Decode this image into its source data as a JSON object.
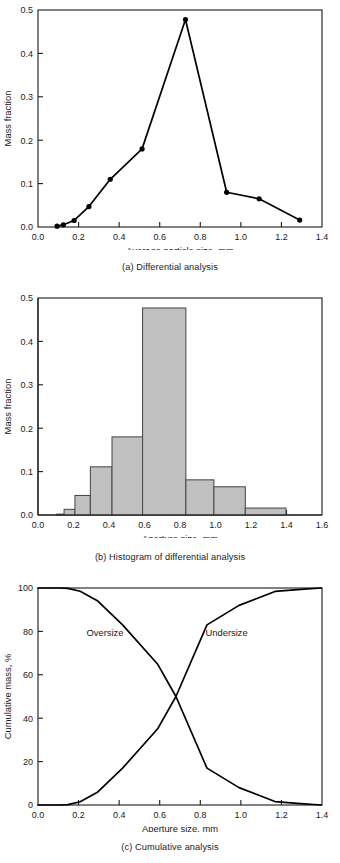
{
  "figure": {
    "panels": [
      {
        "id": "a",
        "caption": "(a) Differential analysis",
        "xlabel": "Average particle size, mm",
        "ylabel": "Mass fraction"
      },
      {
        "id": "b",
        "caption": "(b) Histogram of differential analysis",
        "xlabel": "Aperture size, mm",
        "ylabel": "Mass fraction"
      },
      {
        "id": "c",
        "caption": "(c) Cumulative analysis",
        "xlabel": "Aperture size, mm",
        "ylabel": "Cumulative mass, %"
      }
    ]
  },
  "chart_data": [
    {
      "type": "line",
      "title": "(a) Differential analysis",
      "xlabel": "Average particle size, mm",
      "ylabel": "Mass fraction",
      "xlim": [
        0.0,
        1.4
      ],
      "ylim": [
        0.0,
        0.5
      ],
      "xticks": [
        "0.0",
        "0.2",
        "0.4",
        "0.6",
        "0.8",
        "1.0",
        "1.2",
        "1.4"
      ],
      "xtick_values": [
        0.0,
        0.2,
        0.4,
        0.6,
        0.8,
        1.0,
        1.2,
        1.4
      ],
      "yticks": [
        "0.0",
        "0.1",
        "0.2",
        "0.3",
        "0.4",
        "0.5"
      ],
      "ytick_values": [
        0.0,
        0.1,
        0.2,
        0.3,
        0.4,
        0.5
      ],
      "grid": false,
      "legend": "none",
      "marker": "filled-circle",
      "x": [
        0.094,
        0.125,
        0.178,
        0.251,
        0.356,
        0.513,
        0.727,
        0.93,
        1.09,
        1.29
      ],
      "y": [
        0.002,
        0.005,
        0.015,
        0.047,
        0.11,
        0.18,
        0.478,
        0.08,
        0.065,
        0.016
      ],
      "series": [
        {
          "name": "Mass fraction",
          "values": [
            0.002,
            0.005,
            0.015,
            0.047,
            0.11,
            0.18,
            0.478,
            0.08,
            0.065,
            0.016
          ]
        }
      ]
    },
    {
      "type": "bar",
      "title": "(b) Histogram of differential analysis",
      "xlabel": "Aperture size, mm",
      "ylabel": "Mass fraction",
      "xlim": [
        0.0,
        1.6
      ],
      "ylim": [
        0.0,
        0.5
      ],
      "xticks": [
        "0.0",
        "0.2",
        "0.4",
        "0.6",
        "0.8",
        "1.0",
        "1.2",
        "1.4",
        "1.6"
      ],
      "xtick_values": [
        0.0,
        0.2,
        0.4,
        0.6,
        0.8,
        1.0,
        1.2,
        1.4,
        1.6
      ],
      "yticks": [
        "0.0",
        "0.1",
        "0.2",
        "0.3",
        "0.4",
        "0.5"
      ],
      "ytick_values": [
        0.0,
        0.1,
        0.2,
        0.3,
        0.4,
        0.5
      ],
      "grid": false,
      "legend": "none",
      "bin_edges": [
        0.105,
        0.147,
        0.208,
        0.295,
        0.417,
        0.589,
        0.833,
        0.991,
        1.168,
        1.397
      ],
      "bin_labels": [
        "0.105-0.147",
        "0.147-0.208",
        "0.208-0.295",
        "0.295-0.417",
        "0.417-0.589",
        "0.589-0.833",
        "0.833-0.991",
        "0.991-1.168",
        "1.168-1.397"
      ],
      "values": [
        0.002,
        0.013,
        0.045,
        0.111,
        0.18,
        0.477,
        0.081,
        0.065,
        0.016
      ],
      "bar_fill": "#c0c0c0",
      "bar_stroke": "#4a4a4a"
    },
    {
      "type": "line",
      "title": "(c) Cumulative analysis",
      "xlabel": "Aperture size, mm",
      "ylabel": "Cumulative mass, %",
      "xlim": [
        0.0,
        1.4
      ],
      "ylim": [
        0,
        100
      ],
      "xticks": [
        "0.0",
        "0.2",
        "0.4",
        "0.6",
        "0.8",
        "1.0",
        "1.2",
        "1.4"
      ],
      "xtick_values": [
        0.0,
        0.2,
        0.4,
        0.6,
        0.8,
        1.0,
        1.2,
        1.4
      ],
      "yticks": [
        "0",
        "20",
        "40",
        "60",
        "80",
        "100"
      ],
      "ytick_values": [
        0,
        20,
        40,
        60,
        80,
        100
      ],
      "grid": false,
      "legend": "inline-labels",
      "annotations": [
        {
          "text": "Oversize",
          "x": 0.33,
          "y": 78
        },
        {
          "text": "Undersize",
          "x": 0.93,
          "y": 78
        }
      ],
      "x": [
        0.0,
        0.105,
        0.147,
        0.208,
        0.295,
        0.417,
        0.589,
        0.68,
        0.833,
        0.991,
        1.168,
        1.295,
        1.397
      ],
      "series": [
        {
          "name": "Oversize",
          "values": [
            100,
            100,
            99.8,
            98.5,
            94.0,
            83.0,
            65.0,
            50.0,
            17.0,
            8.0,
            1.6,
            0.6,
            0.0
          ]
        },
        {
          "name": "Undersize",
          "values": [
            0,
            0,
            0.2,
            1.5,
            6.0,
            17.0,
            35.0,
            50.0,
            83.0,
            92.0,
            98.4,
            99.4,
            100
          ]
        }
      ]
    }
  ],
  "axis_text": {
    "a": {
      "ylabel": "Mass fraction",
      "xlabel": "Average particle size, mm",
      "yticks": [
        "0.5",
        "0.4",
        "0.3",
        "0.2",
        "0.1",
        "0.0"
      ],
      "xticks": [
        "0.0",
        "0.2",
        "0.4",
        "0.6",
        "0.8",
        "1.0",
        "1.2",
        "1.4"
      ]
    },
    "b": {
      "ylabel": "Mass fraction",
      "xlabel": "Aperture size, mm",
      "yticks": [
        "0.5",
        "0.4",
        "0.3",
        "0.2",
        "0.1",
        "0.0"
      ],
      "xticks": [
        "0.0",
        "0.2",
        "0.4",
        "0.6",
        "0.8",
        "1.0",
        "1.2",
        "1.4",
        "1.6"
      ]
    },
    "c": {
      "ylabel": "Cumulative mass, %",
      "xlabel": "Aperture size, mm",
      "yticks": [
        "100",
        "80",
        "60",
        "40",
        "20",
        "0"
      ],
      "xticks": [
        "0.0",
        "0.2",
        "0.4",
        "0.6",
        "0.8",
        "1.0",
        "1.2",
        "1.4"
      ]
    }
  },
  "labels": {
    "oversize": "Oversize",
    "undersize": "Undersize"
  },
  "colors": {
    "ink": "#1a1a1a",
    "line": "#000000",
    "bar_fill": "#c0c0c0",
    "bar_stroke": "#4a4a4a",
    "background": "#ffffff"
  }
}
